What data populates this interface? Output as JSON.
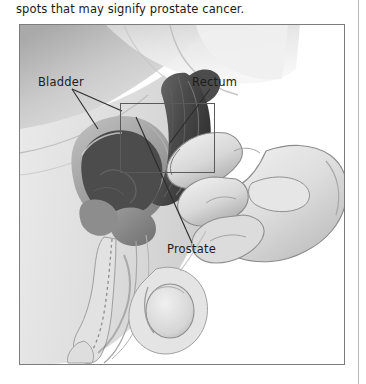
{
  "page": {
    "caption": "spots that may signify prostate cancer."
  },
  "figure": {
    "alt_name": "digital-rectal-exam-illustration",
    "style": "grayscale medical line illustration, sagittal cross-section of male pelvis with gloved examining hand",
    "labels": [
      {
        "id": "bladder",
        "text": "Bladder"
      },
      {
        "id": "rectum",
        "text": "Rectum"
      },
      {
        "id": "prostate",
        "text": "Prostate"
      }
    ],
    "callout": {
      "name": "detail-callout-rectangle"
    },
    "colors": {
      "frame_border": "#7d7d7d",
      "callout_border": "#5a5a5a",
      "label_text": "#1c1c1c",
      "caption_text": "#1a1a1a",
      "skin_light": "#e9e9e9",
      "skin_mid": "#cfcfcf",
      "skin_shadow": "#9a9a9a",
      "organ_dark": "#555555",
      "divider": "#b8b8b8"
    }
  }
}
